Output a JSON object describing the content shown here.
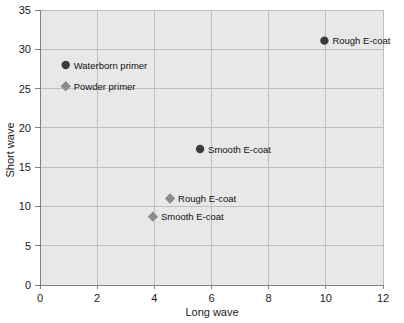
{
  "chart_data": {
    "type": "scatter",
    "title": "",
    "xlabel": "Long wave",
    "ylabel": "Short wave",
    "xlim": [
      0,
      12
    ],
    "ylim": [
      0,
      35
    ],
    "xticks": [
      0,
      2,
      4,
      6,
      8,
      10,
      12
    ],
    "yticks": [
      0,
      5,
      10,
      15,
      20,
      25,
      30,
      35
    ],
    "grid": true,
    "legend": "none",
    "plot_background": "#e8e8e8",
    "grid_color": "#bfbfbf",
    "axis_color": "#808080",
    "series": [
      {
        "name": "Circle markers",
        "marker": "circle",
        "color": "#3c3c3c",
        "points": [
          {
            "label": "Waterborn primer",
            "x": 0.9,
            "y": 28.0
          },
          {
            "label": "Smooth E-coat",
            "x": 5.6,
            "y": 17.3
          },
          {
            "label": "Rough E-coat",
            "x": 9.95,
            "y": 31.1
          }
        ]
      },
      {
        "name": "Diamond markers",
        "marker": "diamond",
        "color": "#8c8c8c",
        "points": [
          {
            "label": "Powder primer",
            "x": 0.9,
            "y": 25.3
          },
          {
            "label": "Rough E-coat",
            "x": 4.55,
            "y": 11.0
          },
          {
            "label": "Smooth E-coat",
            "x": 3.95,
            "y": 8.7
          }
        ]
      }
    ]
  }
}
